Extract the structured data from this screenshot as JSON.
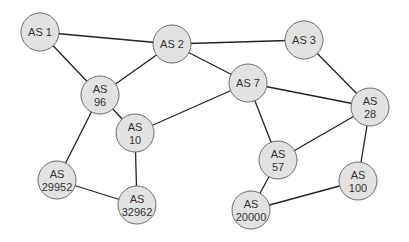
{
  "diagram": {
    "type": "network-topology",
    "node_fill": "#e2e2e2",
    "node_stroke": "#6a6a6a",
    "edge_color": "#222222",
    "nodes": [
      {
        "id": "as1",
        "lines": [
          "AS 1"
        ],
        "x": 40,
        "y": 32
      },
      {
        "id": "as2",
        "lines": [
          "AS 2"
        ],
        "x": 172,
        "y": 44
      },
      {
        "id": "as3",
        "lines": [
          "AS 3"
        ],
        "x": 304,
        "y": 40
      },
      {
        "id": "as96",
        "lines": [
          "AS",
          "96"
        ],
        "x": 100,
        "y": 95
      },
      {
        "id": "as7",
        "lines": [
          "AS 7"
        ],
        "x": 248,
        "y": 83
      },
      {
        "id": "as28",
        "lines": [
          "AS",
          "28"
        ],
        "x": 370,
        "y": 107
      },
      {
        "id": "as10",
        "lines": [
          "AS",
          "10"
        ],
        "x": 135,
        "y": 133
      },
      {
        "id": "as57",
        "lines": [
          "AS",
          "57"
        ],
        "x": 278,
        "y": 160
      },
      {
        "id": "as100",
        "lines": [
          "AS",
          "100"
        ],
        "x": 358,
        "y": 181
      },
      {
        "id": "as29952",
        "lines": [
          "AS",
          "29952"
        ],
        "x": 57,
        "y": 180
      },
      {
        "id": "as32962",
        "lines": [
          "AS",
          "32962"
        ],
        "x": 137,
        "y": 205
      },
      {
        "id": "as20000",
        "lines": [
          "AS",
          "20000"
        ],
        "x": 251,
        "y": 210
      }
    ],
    "edges": [
      [
        "as1",
        "as2"
      ],
      [
        "as1",
        "as96"
      ],
      [
        "as2",
        "as96"
      ],
      [
        "as2",
        "as3"
      ],
      [
        "as2",
        "as7"
      ],
      [
        "as3",
        "as28"
      ],
      [
        "as7",
        "as28"
      ],
      [
        "as7",
        "as10"
      ],
      [
        "as7",
        "as57"
      ],
      [
        "as96",
        "as10"
      ],
      [
        "as96",
        "as29952"
      ],
      [
        "as10",
        "as32962"
      ],
      [
        "as29952",
        "as32962"
      ],
      [
        "as28",
        "as57"
      ],
      [
        "as28",
        "as100"
      ],
      [
        "as57",
        "as20000"
      ],
      [
        "as100",
        "as20000"
      ]
    ]
  }
}
